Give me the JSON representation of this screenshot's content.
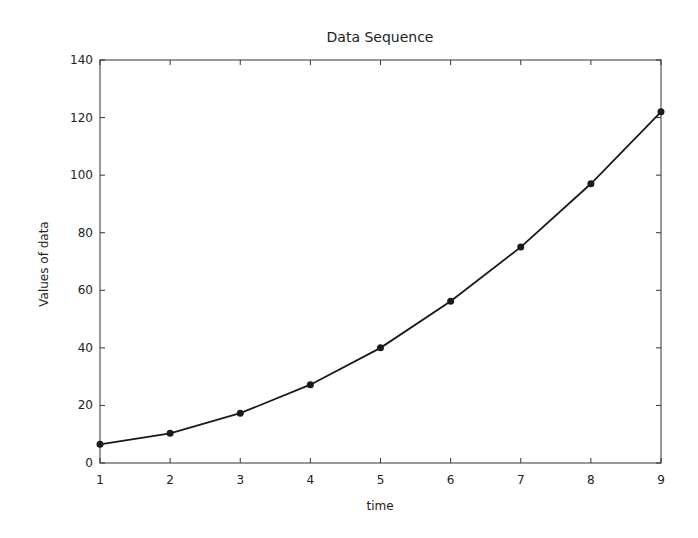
{
  "chart_data": {
    "type": "line",
    "title": "Data Sequence",
    "xlabel": "time",
    "ylabel": "Values of data",
    "x": [
      1,
      2,
      3,
      4,
      5,
      6,
      7,
      8,
      9
    ],
    "series": [
      {
        "name": "data",
        "values": [
          6.5,
          10.3,
          17.3,
          27.2,
          40.0,
          56.2,
          75.0,
          97.0,
          122.0
        ],
        "color": "#1a1a1a",
        "marker": "circle"
      }
    ],
    "xlim": [
      1,
      9
    ],
    "ylim": [
      0,
      140
    ],
    "xticks": [
      "1",
      "2",
      "3",
      "4",
      "5",
      "6",
      "7",
      "8",
      "9"
    ],
    "yticks": [
      "0",
      "20",
      "40",
      "60",
      "80",
      "100",
      "120",
      "140"
    ],
    "grid": false,
    "legend": null
  }
}
